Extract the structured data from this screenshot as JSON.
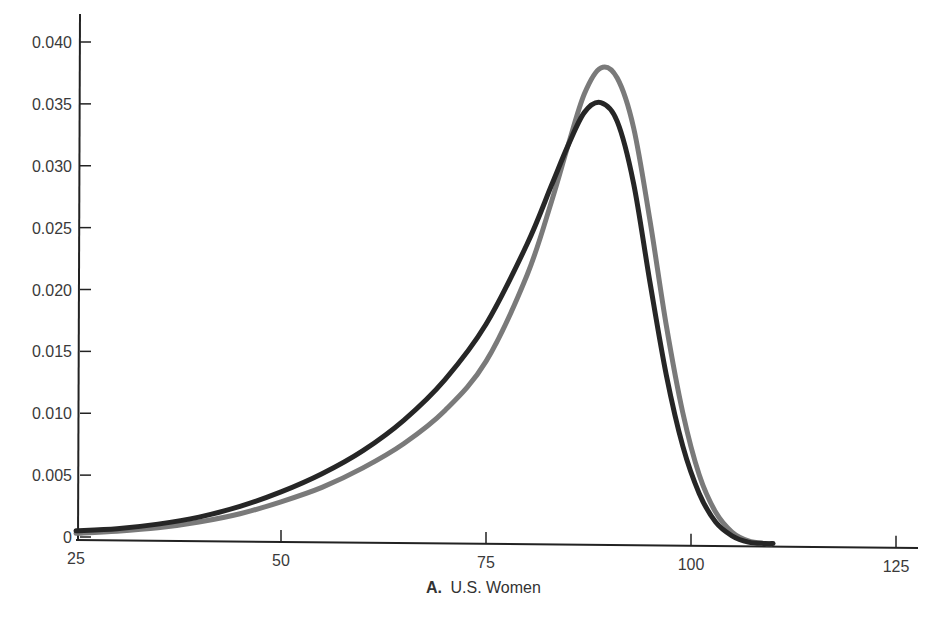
{
  "chart_data": {
    "type": "line",
    "title": "",
    "caption": {
      "prefix": "A.",
      "text": "U.S. Women"
    },
    "xlabel": "U.S. Women",
    "ylabel": "",
    "xlim": [
      25,
      125
    ],
    "ylim": [
      0,
      0.042
    ],
    "grid": false,
    "legend": null,
    "x_ticks": [
      25,
      50,
      75,
      100,
      125
    ],
    "x_tick_labels": [
      "25",
      "50",
      "75",
      "100",
      "125"
    ],
    "y_ticks": [
      0,
      0.005,
      0.01,
      0.015,
      0.02,
      0.025,
      0.03,
      0.035,
      0.04
    ],
    "y_tick_labels": [
      "0",
      "0.005",
      "0.010",
      "0.015",
      "0.020",
      "0.025",
      "0.030",
      "0.035",
      "0.040"
    ],
    "series": [
      {
        "name": "gray-curve",
        "color": "#7a7a7a",
        "x": [
          25,
          30,
          35,
          40,
          45,
          50,
          55,
          60,
          65,
          70,
          75,
          80,
          83,
          85,
          87,
          89,
          91,
          93,
          95,
          97,
          99,
          101,
          103,
          105,
          107,
          109,
          110
        ],
        "y": [
          0.0003,
          0.0005,
          0.0008,
          0.0013,
          0.002,
          0.003,
          0.0042,
          0.0058,
          0.0078,
          0.0105,
          0.0145,
          0.0215,
          0.0275,
          0.032,
          0.0362,
          0.0383,
          0.0375,
          0.0335,
          0.026,
          0.0175,
          0.0105,
          0.0055,
          0.0025,
          0.0009,
          0.0002,
          0.0,
          0.0
        ]
      },
      {
        "name": "black-curve",
        "color": "#262626",
        "x": [
          25,
          30,
          35,
          40,
          45,
          50,
          55,
          60,
          65,
          70,
          75,
          80,
          83,
          85,
          87,
          89,
          91,
          93,
          95,
          97,
          99,
          101,
          103,
          105,
          107,
          109,
          110
        ],
        "y": [
          0.0005,
          0.0007,
          0.0011,
          0.0017,
          0.0026,
          0.0038,
          0.0053,
          0.0072,
          0.0097,
          0.013,
          0.0175,
          0.024,
          0.0288,
          0.032,
          0.0347,
          0.0355,
          0.034,
          0.029,
          0.021,
          0.0135,
          0.0078,
          0.004,
          0.0017,
          0.0006,
          0.0001,
          0.0,
          0.0
        ]
      }
    ]
  }
}
